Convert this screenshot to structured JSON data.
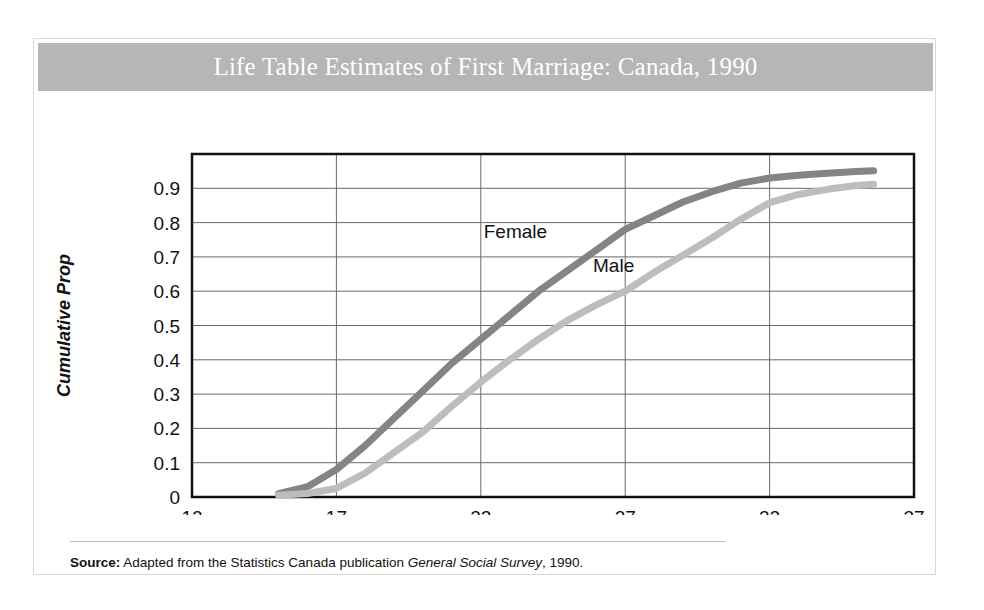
{
  "figure": {
    "title": "Life Table Estimates of First Marriage: Canada, 1990",
    "banner_color": "#b6b6b6",
    "title_color": "#ffffff",
    "source_label": "Source:",
    "source_text_1": "Adapted from the Statistics Canada publication",
    "source_text_italic": "General Social Survey",
    "source_text_2": ", 1990."
  },
  "chart_data": {
    "type": "line",
    "title": "Life Table Estimates of First Marriage: Canada, 1990",
    "xlabel": "Age",
    "ylabel": "Cumulative Prop",
    "xlim": [
      12,
      37
    ],
    "ylim": [
      0,
      1.0
    ],
    "xticks": [
      12,
      17,
      22,
      27,
      32,
      37
    ],
    "xtick_labels": [
      "12",
      "17",
      "22",
      "27",
      "32",
      "37"
    ],
    "yticks": [
      0,
      0.1,
      0.2,
      0.3,
      0.4,
      0.5,
      0.6,
      0.7,
      0.8,
      0.9
    ],
    "ytick_labels": [
      "0",
      "0.1",
      "0.2",
      "0.3",
      "0.4",
      "0.5",
      "0.6",
      "0.7",
      "0.8",
      "0.9"
    ],
    "grid": "horizontal-and-vertical",
    "legend": "inline-labels",
    "series": [
      {
        "name": "Female",
        "color": "#848484",
        "label_x": 23.2,
        "label_y": 0.755,
        "x": [
          15,
          16,
          17,
          18,
          19,
          20,
          21,
          22,
          23,
          24,
          25,
          26,
          27,
          28,
          29,
          30,
          31,
          32,
          33,
          34,
          35,
          35.6
        ],
        "y": [
          0.01,
          0.03,
          0.08,
          0.15,
          0.23,
          0.31,
          0.39,
          0.46,
          0.53,
          0.6,
          0.66,
          0.72,
          0.78,
          0.82,
          0.86,
          0.89,
          0.915,
          0.93,
          0.938,
          0.944,
          0.949,
          0.951
        ]
      },
      {
        "name": "Male",
        "color": "#bdbdbd",
        "label_x": 26.6,
        "label_y": 0.655,
        "x": [
          15,
          16,
          17,
          18,
          19,
          20,
          21,
          22,
          23,
          24,
          25,
          26,
          27,
          28,
          29,
          30,
          31,
          32,
          33,
          34,
          35,
          35.6
        ],
        "y": [
          0.005,
          0.01,
          0.025,
          0.07,
          0.13,
          0.19,
          0.265,
          0.335,
          0.4,
          0.46,
          0.515,
          0.56,
          0.6,
          0.655,
          0.705,
          0.755,
          0.81,
          0.858,
          0.882,
          0.897,
          0.908,
          0.912
        ]
      }
    ]
  }
}
